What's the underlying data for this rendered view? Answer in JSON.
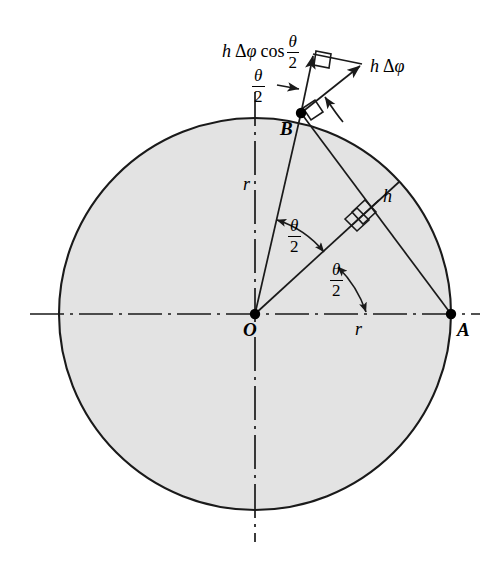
{
  "figure": {
    "type": "geometry-diagram",
    "background_color": "#ffffff",
    "circle_fill_color": "#e3e3e3",
    "stroke_color": "#1a1a1a"
  },
  "labels": {
    "origin": "O",
    "point_a": "A",
    "point_b": "B",
    "radius_ob": "r",
    "radius_oa": "r",
    "height_h": "h"
  },
  "angles": [
    {
      "name": "angle-at-b-top",
      "theta": "θ",
      "over": "2"
    },
    {
      "name": "angle-upper-at-o",
      "theta": "θ",
      "over": "2"
    },
    {
      "name": "angle-lower-at-o",
      "theta": "θ",
      "over": "2"
    }
  ],
  "expressions": {
    "component_vector": {
      "name": "h-delta-phi-cos-theta-over-2",
      "h": "h",
      "delta": "Δ",
      "phi": "φ",
      "cos": "cos",
      "theta": "θ",
      "denominator": "2"
    },
    "resultant_vector": {
      "name": "h-delta-phi",
      "h": "h",
      "delta": "Δ",
      "phi": "φ"
    }
  },
  "geometry": {
    "circle_center": {
      "x": 255,
      "y": 314
    },
    "circle_radius": 196,
    "point_a": {
      "x": 451,
      "y": 314
    },
    "point_b": {
      "x": 301,
      "y": 113
    },
    "vector_component_tip": {
      "x": 313,
      "y": 54
    },
    "vector_resultant_tip": {
      "x": 361,
      "y": 67
    },
    "right_angle_marks": 4
  }
}
